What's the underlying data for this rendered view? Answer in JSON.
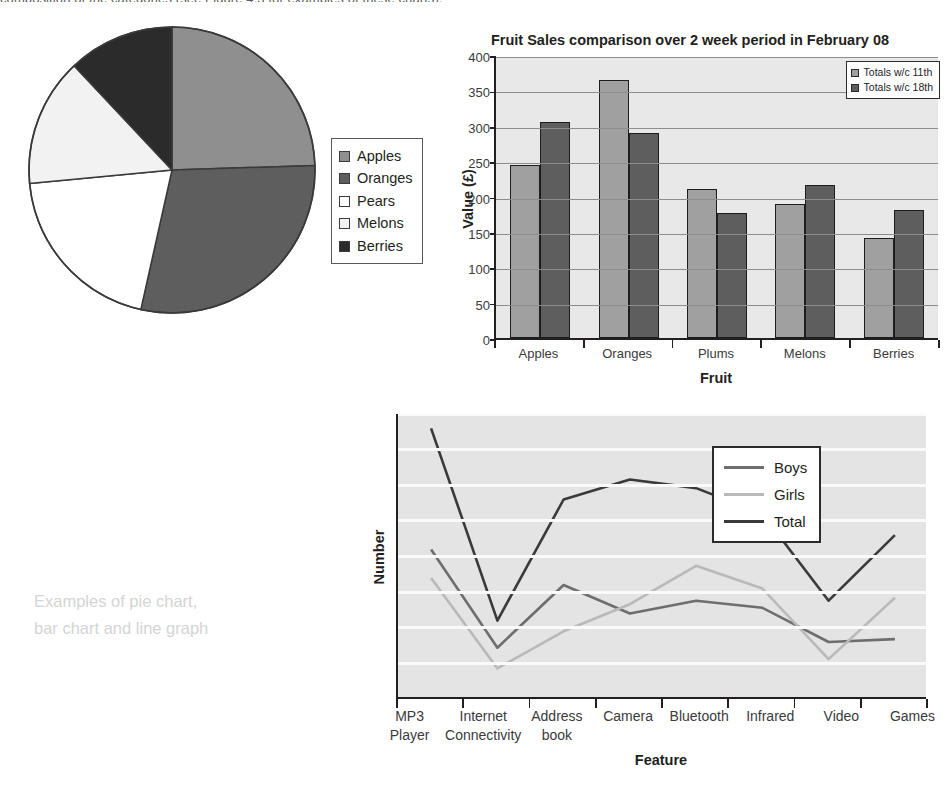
{
  "page": {
    "top_cut_text": "composition of the categories (see Figure 4.3 for examples of these charts).",
    "caption": "Examples of pie chart,\nbar chart and line graph"
  },
  "pie_chart": {
    "name": "fruit-sales-pie-chart",
    "legend_items": [
      {
        "label": "Apples",
        "color": "#8f8f8f"
      },
      {
        "label": "Oranges",
        "color": "#5e5e5e"
      },
      {
        "label": "Pears",
        "color": "#ffffff"
      },
      {
        "label": "Melons",
        "color": "#f2f2f2"
      },
      {
        "label": "Berries",
        "color": "#2b2b2b"
      }
    ]
  },
  "bar_chart": {
    "name": "fruit-sales-bar-chart",
    "legend_items": [
      {
        "label": "Totals w/c 11th",
        "color": "#a0a0a0"
      },
      {
        "label": "Totals w/c 18th",
        "color": "#5e5e5e"
      }
    ]
  },
  "line_chart": {
    "name": "mobile-feature-line-chart",
    "legend_items": [
      {
        "label": "Boys",
        "color": "#6e6e6e"
      },
      {
        "label": "Girls",
        "color": "#b9b9b9"
      },
      {
        "label": "Total",
        "color": "#3a3a3a"
      }
    ]
  },
  "chart_data": [
    {
      "type": "pie",
      "title": "",
      "labels": [
        "Apples",
        "Oranges",
        "Pears",
        "Melons",
        "Berries"
      ],
      "values": [
        24.5,
        29.0,
        20.0,
        14.5,
        12.0
      ],
      "unit": "percent",
      "start_angle_deg": 0,
      "direction": "clockwise",
      "slice_colors": [
        "#8f8f8f",
        "#5e5e5e",
        "#ffffff",
        "#f2f2f2",
        "#2b2b2b"
      ],
      "legend_position": "right",
      "grid": false
    },
    {
      "type": "bar",
      "title": "Fruit Sales comparison over 2 week period in February 08",
      "xlabel": "Fruit",
      "ylabel": "Value (£)",
      "categories": [
        "Apples",
        "Oranges",
        "Plums",
        "Melons",
        "Berries"
      ],
      "series": [
        {
          "name": "Totals w/c 11th",
          "color": "#a0a0a0",
          "values": [
            245,
            365,
            210,
            190,
            142
          ]
        },
        {
          "name": "Totals w/c 18th",
          "color": "#5e5e5e",
          "values": [
            305,
            290,
            177,
            216,
            181
          ]
        }
      ],
      "ylim": [
        0,
        400
      ],
      "yticks": [
        0,
        50,
        100,
        150,
        200,
        250,
        300,
        350,
        400
      ],
      "grid": true,
      "legend_position": "top-right"
    },
    {
      "type": "line",
      "title": "",
      "xlabel": "Feature",
      "ylabel": "Number",
      "categories": [
        "MP3 Player",
        "Internet Connectivity",
        "Address book",
        "Camera",
        "Bluetooth",
        "Infrared",
        "Video",
        "Games"
      ],
      "category_lines": [
        [
          "MP3 Player",
          ""
        ],
        [
          "Internet",
          "Connectivity"
        ],
        [
          "Address",
          "book"
        ],
        [
          "Camera",
          ""
        ],
        [
          "Bluetooth",
          ""
        ],
        [
          "Infrared",
          ""
        ],
        [
          "Video",
          ""
        ],
        [
          "Games",
          ""
        ]
      ],
      "series": [
        {
          "name": "Boys",
          "color": "#6e6e6e",
          "values": [
            21,
            7.2,
            16,
            12,
            13.8,
            12.8,
            8,
            8.4
          ]
        },
        {
          "name": "Girls",
          "color": "#b9b9b9",
          "values": [
            17,
            4.3,
            9.5,
            13.3,
            18.7,
            15.5,
            5.6,
            14.2
          ]
        },
        {
          "name": "Total",
          "color": "#3a3a3a",
          "values": [
            38,
            11,
            28,
            30.8,
            29.6,
            26,
            13.8,
            23
          ]
        }
      ],
      "ylim": [
        0,
        40
      ],
      "yticks": [
        0,
        5,
        10,
        15,
        20,
        25,
        30,
        35,
        40
      ],
      "grid": true,
      "legend_position": "inside-top-right"
    }
  ]
}
